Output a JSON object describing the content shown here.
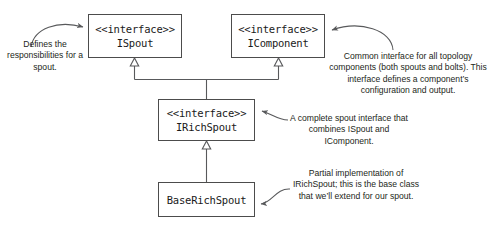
{
  "diagram": {
    "type": "uml-class-diagram",
    "background_color": "#ffffff",
    "box_border_color": "#4c4c4c",
    "connector_color": "#58595b",
    "text_color": "#231f20",
    "stereotype": "<<interface>>",
    "boxes": [
      {
        "id": "ispout",
        "stereotype": "<<interface>>",
        "name": "ISpout",
        "has_stereotype": true
      },
      {
        "id": "icomponent",
        "stereotype": "<<interface>>",
        "name": "IComponent",
        "has_stereotype": true
      },
      {
        "id": "irichspout",
        "stereotype": "<<interface>>",
        "name": "IRichSpout",
        "has_stereotype": true
      },
      {
        "id": "baserichspout",
        "stereotype": "",
        "name": "BaseRichSpout",
        "has_stereotype": false
      }
    ],
    "annotations": {
      "ispout": "Defines the responsibilities for a spout.",
      "icomponent": "Common interface for all topology components (both spouts and bolts). This interface defines a component’s configuration and output.",
      "irichspout": "A complete spout interface that combines ISpout and IComponent.",
      "baserichspout": "Partial implementation of IRichSpout; this is the base class that we’ll extend for our spout."
    },
    "relationships": [
      {
        "from": "irichspout",
        "to": "ispout",
        "type": "generalization",
        "arrowhead": "hollow-triangle"
      },
      {
        "from": "irichspout",
        "to": "icomponent",
        "type": "generalization",
        "arrowhead": "hollow-triangle"
      },
      {
        "from": "baserichspout",
        "to": "irichspout",
        "type": "generalization",
        "arrowhead": "hollow-triangle"
      }
    ]
  }
}
